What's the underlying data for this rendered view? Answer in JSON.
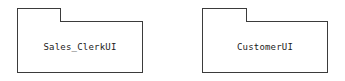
{
  "diagram": {
    "type": "uml-package-diagram",
    "background_color": "#ffffff",
    "stroke_color": "#3b3b3b",
    "text_color": "#1b1b1b",
    "packages": [
      {
        "id": "sales-clerk-ui",
        "label": "Sales_ClerkUI"
      },
      {
        "id": "customer-ui",
        "label": "CustomerUI"
      }
    ]
  }
}
